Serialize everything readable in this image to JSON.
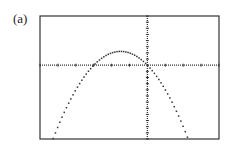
{
  "panel_label": "(a)",
  "chart_data": {
    "type": "line",
    "title": "",
    "xlabel": "",
    "ylabel": "",
    "xlim": [
      -6,
      4
    ],
    "ylim": [
      -12,
      8
    ],
    "xscale_ticks": 1,
    "yscale_ticks": 1,
    "grid": false,
    "style": "graphing-calculator dotted plot",
    "series": [
      {
        "name": "parabola",
        "equation": "y = -x^2 - 3x",
        "x": [
          -5.25,
          -5,
          -4.5,
          -4,
          -3.5,
          -3,
          -2.5,
          -2,
          -1.5,
          -1,
          -0.5,
          0,
          0.5,
          1,
          1.5,
          2,
          2.25
        ],
        "y": [
          -11.81,
          -10,
          -6.75,
          -4,
          -1.75,
          0,
          1.25,
          2,
          2.25,
          2,
          1.25,
          0,
          -1.75,
          -4,
          -6.75,
          -10,
          -11.81
        ]
      }
    ]
  }
}
